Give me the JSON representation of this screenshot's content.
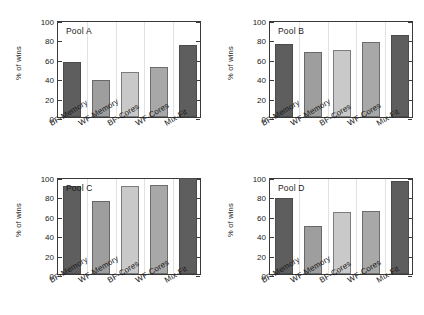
{
  "figure": {
    "title": "",
    "background": "#ffffff",
    "panel_count": 4
  },
  "axis": {
    "ylabel": "% of wins",
    "yticks": [
      "0",
      "20",
      "40",
      "60",
      "80",
      "100"
    ],
    "ymin": 0,
    "ymax": 100
  },
  "categories": [
    "BF-Memory",
    "WF-Memory",
    "BF-Cores",
    "WF-Cores",
    "Mix-Fit"
  ],
  "bar_colors": [
    "#5e5e5e",
    "#9e9e9e",
    "#c9c9c9",
    "#a8a8a8",
    "#5e5e5e"
  ],
  "panels": [
    {
      "tag": "Pool A",
      "values": [
        57,
        38.5,
        46.5,
        51.5,
        74
      ]
    },
    {
      "tag": "Pool B",
      "values": [
        75,
        67,
        69.5,
        77,
        85
      ]
    },
    {
      "tag": "Pool C",
      "values": [
        91,
        75.5,
        91,
        92,
        98.5
      ]
    },
    {
      "tag": "Pool D",
      "values": [
        78,
        50,
        64,
        65,
        95.5
      ]
    }
  ],
  "chart_data": {
    "type": "bar",
    "xlabel": "",
    "ylabel": "% of wins",
    "ylim": [
      0,
      100
    ],
    "ytick_step": 20,
    "grid": "vertical-only",
    "legend": "none",
    "layout": "2x2 small multiples",
    "categories": [
      "BF-Memory",
      "WF-Memory",
      "BF-Cores",
      "WF-Cores",
      "Mix-Fit"
    ],
    "panels": [
      {
        "annotation": "Pool A",
        "categories": [
          "BF-Memory",
          "WF-Memory",
          "BF-Cores",
          "WF-Cores",
          "Mix-Fit"
        ],
        "values": [
          57,
          38.5,
          46.5,
          51.5,
          74
        ]
      },
      {
        "annotation": "Pool B",
        "categories": [
          "BF-Memory",
          "WF-Memory",
          "BF-Cores",
          "WF-Cores",
          "Mix-Fit"
        ],
        "values": [
          75,
          67,
          69.5,
          77,
          85
        ]
      },
      {
        "annotation": "Pool C",
        "categories": [
          "BF-Memory",
          "WF-Memory",
          "BF-Cores",
          "WF-Cores",
          "Mix-Fit"
        ],
        "values": [
          91,
          75.5,
          91,
          92,
          98.5
        ]
      },
      {
        "annotation": "Pool D",
        "categories": [
          "BF-Memory",
          "WF-Memory",
          "BF-Cores",
          "WF-Cores",
          "Mix-Fit"
        ],
        "values": [
          78,
          50,
          64,
          65,
          95.5
        ]
      }
    ],
    "series": [
      {
        "name": "Pool A",
        "values": [
          57,
          38.5,
          46.5,
          51.5,
          74
        ]
      },
      {
        "name": "Pool B",
        "values": [
          75,
          67,
          69.5,
          77,
          85
        ]
      },
      {
        "name": "Pool C",
        "values": [
          91,
          75.5,
          91,
          92,
          98.5
        ]
      },
      {
        "name": "Pool D",
        "values": [
          78,
          50,
          64,
          65,
          95.5
        ]
      }
    ]
  }
}
